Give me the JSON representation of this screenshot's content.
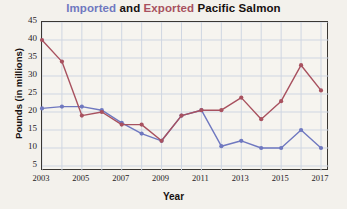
{
  "title": {
    "full": "Imported and Exported Pacific Salmon",
    "part_imported": "Imported",
    "part_and": " and ",
    "part_exported": "Exported",
    "part_rest": " Pacific Salmon",
    "color_imported": "#6f78c0",
    "color_exported": "#a8515f",
    "color_plain": "#16100f"
  },
  "axes": {
    "xlabel": "Year",
    "ylabel": "Pounds (in millions)",
    "yticks": [
      45,
      40,
      35,
      30,
      25,
      20,
      15,
      10,
      5
    ],
    "xticks": [
      2003,
      2005,
      2007,
      2009,
      2011,
      2013,
      2015,
      2017
    ]
  },
  "chart_data": {
    "type": "line",
    "title": "Imported and Exported Pacific Salmon",
    "xlabel": "Year",
    "ylabel": "Pounds (in millions)",
    "xlim": [
      2003,
      2017
    ],
    "ylim": [
      0,
      45
    ],
    "grid": true,
    "legend": "none (series named in title by color)",
    "x": [
      2003,
      2004,
      2005,
      2006,
      2007,
      2008,
      2009,
      2010,
      2011,
      2012,
      2013,
      2014,
      2015,
      2016,
      2017
    ],
    "series": [
      {
        "name": "Imported",
        "color": "#6f78c0",
        "marker": "circle",
        "values": [
          21,
          21.5,
          21.5,
          20.5,
          17,
          14,
          12,
          19,
          20.5,
          10.5,
          12,
          10,
          10,
          15,
          10
        ]
      },
      {
        "name": "Exported",
        "color": "#a8515f",
        "marker": "circle",
        "values": [
          40,
          34,
          19,
          20,
          16.5,
          16.5,
          12,
          19,
          20.5,
          20.5,
          24,
          18,
          23,
          33,
          26
        ]
      }
    ]
  }
}
